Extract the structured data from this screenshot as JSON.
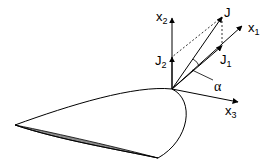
{
  "diagram": {
    "type": "vector-decomposition on airfoil",
    "labels": {
      "x1": {
        "base": "x",
        "sub": "1"
      },
      "x2": {
        "base": "x",
        "sub": "2"
      },
      "x3": {
        "base": "x",
        "sub": "3"
      },
      "J": {
        "base": "J",
        "sub": ""
      },
      "J1": {
        "base": "J",
        "sub": "1"
      },
      "J2": {
        "base": "J",
        "sub": "2"
      },
      "alpha": "α"
    },
    "colors": {
      "line": "#000000",
      "airfoil_shade": "#8c8c8c",
      "background": "#ffffff"
    }
  }
}
